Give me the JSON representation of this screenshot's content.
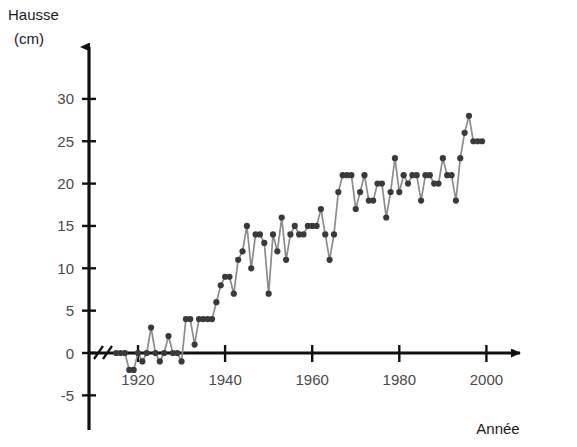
{
  "chart_data": {
    "type": "line",
    "title": "",
    "xlabel": "Année",
    "ylabel": "Hausse (cm)",
    "ylabel_line1": "Hausse",
    "ylabel_line2": "(cm)",
    "xlim": [
      1913,
      2003
    ],
    "ylim": [
      -5,
      32
    ],
    "xticks": [
      1920,
      1940,
      1960,
      1980,
      2000
    ],
    "xtick_labels": [
      "1920",
      "1940",
      "1960",
      "1980",
      "2000"
    ],
    "yticks": [
      -5,
      0,
      5,
      10,
      15,
      20,
      25,
      30
    ],
    "ytick_labels": [
      "-5",
      "0",
      "5",
      "10",
      "15",
      "20",
      "25",
      "30"
    ],
    "grid": false,
    "legend": null,
    "axis_break": "//",
    "axis_break_note": "rupture d'échelle sur l'axe des abscisses près de l'origine",
    "marker": "filled-circle",
    "line_color": "#8c8c8c",
    "marker_color": "#3a3a3a",
    "axis_color": "#111111",
    "x": [
      1915,
      1916,
      1917,
      1918,
      1919,
      1920,
      1921,
      1922,
      1923,
      1924,
      1925,
      1926,
      1927,
      1928,
      1929,
      1930,
      1931,
      1932,
      1933,
      1934,
      1935,
      1936,
      1937,
      1938,
      1939,
      1940,
      1941,
      1942,
      1943,
      1944,
      1945,
      1946,
      1947,
      1948,
      1949,
      1950,
      1951,
      1952,
      1953,
      1954,
      1955,
      1956,
      1957,
      1958,
      1959,
      1960,
      1961,
      1962,
      1963,
      1964,
      1965,
      1966,
      1967,
      1968,
      1969,
      1970,
      1971,
      1972,
      1973,
      1974,
      1975,
      1976,
      1977,
      1978,
      1979,
      1980,
      1981,
      1982,
      1983,
      1984,
      1985,
      1986,
      1987,
      1988,
      1989,
      1990,
      1991,
      1992,
      1993,
      1994,
      1995,
      1996,
      1997,
      1998,
      1999
    ],
    "values": [
      0,
      0,
      0,
      -2,
      -2,
      0,
      -1,
      0,
      3,
      0,
      -1,
      0,
      2,
      0,
      0,
      -1,
      4,
      4,
      1,
      4,
      4,
      4,
      4,
      6,
      8,
      9,
      9,
      7,
      11,
      12,
      15,
      10,
      14,
      14,
      13,
      7,
      14,
      12,
      16,
      11,
      14,
      15,
      14,
      14,
      15,
      15,
      15,
      17,
      14,
      11,
      14,
      19,
      21,
      21,
      21,
      17,
      19,
      21,
      18,
      18,
      20,
      20,
      16,
      19,
      23,
      19,
      21,
      20,
      21,
      21,
      18,
      21,
      21,
      20,
      20,
      23,
      21,
      21,
      18,
      23,
      26,
      28,
      25,
      25,
      25
    ],
    "series_name": "Hausse du niveau de la mer",
    "units": "cm"
  }
}
